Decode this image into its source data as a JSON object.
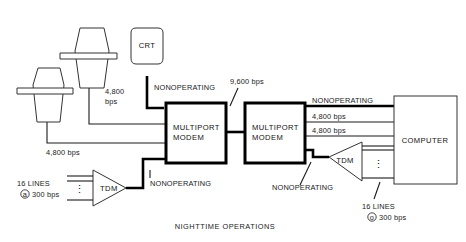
{
  "figure": {
    "caption": "NIGHTTIME OPERATIONS"
  },
  "nodes": {
    "terminal_left": {
      "name": "teletype-terminal"
    },
    "terminal_upper": {
      "name": "teletype-terminal"
    },
    "crt": {
      "label": "CRT"
    },
    "modem_left": {
      "label_line1": "MULTIPORT",
      "label_line2": "MODEM"
    },
    "modem_right": {
      "label_line1": "MULTIPORT",
      "label_line2": "MODEM"
    },
    "computer": {
      "label": "COMPUTER"
    },
    "tdm_left": {
      "label": "TDM"
    },
    "tdm_right": {
      "label": "TDM"
    }
  },
  "link_labels": {
    "terminal_upper_rate_line1": "4,800",
    "terminal_upper_rate_line2": "bps",
    "crt_status": "NONOPERATING",
    "trunk_rate": "9,600 bps",
    "terminal_left_rate": "4,800 bps",
    "tdm_left_status": "NONOPERATING",
    "computer_link_status": "NONOPERATING",
    "computer_link_rate_1": "4,800 bps",
    "computer_link_rate_2": "4,800 bps",
    "tdm_right_status": "NONOPERATING"
  },
  "line_groups": {
    "left": {
      "count_label": "16 LINES",
      "rate_label": "300 bps",
      "at_symbol": "a"
    },
    "right": {
      "count_label": "16 LINES",
      "rate_label": "300 bps",
      "at_symbol": "o"
    }
  }
}
